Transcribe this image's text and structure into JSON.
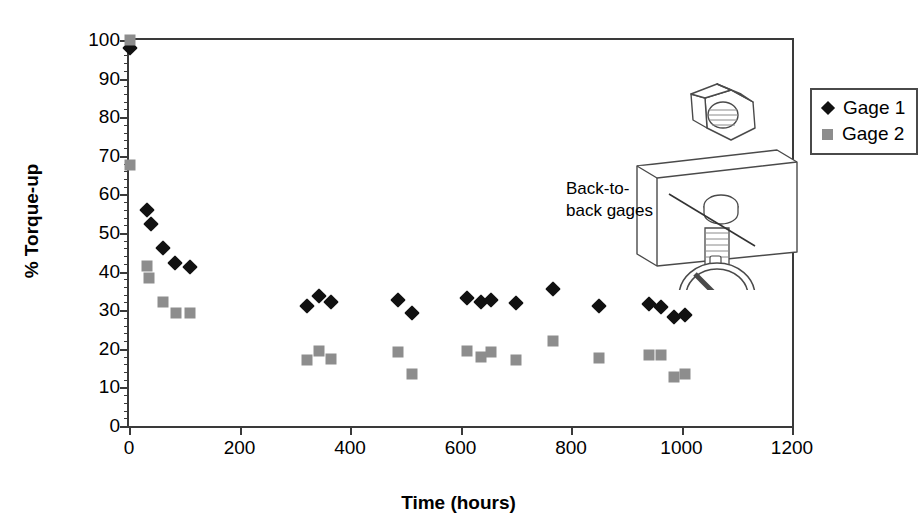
{
  "chart_data": {
    "type": "scatter",
    "title": "",
    "xlabel": "Time (hours)",
    "ylabel": "% Torque-up",
    "xlim": [
      0,
      1200
    ],
    "ylim": [
      0,
      100
    ],
    "xticks": [
      0,
      200,
      400,
      600,
      800,
      1000,
      1200
    ],
    "yticks": [
      0,
      10,
      20,
      30,
      40,
      50,
      60,
      70,
      80,
      90,
      100
    ],
    "y_minor_tick_step": 2,
    "grid": false,
    "legend_position": "top-right",
    "series": [
      {
        "name": "Gage 1",
        "marker": "diamond",
        "color": "#111111",
        "points": [
          [
            2,
            98.0
          ],
          [
            33,
            56.0
          ],
          [
            40,
            52.3
          ],
          [
            62,
            46.0
          ],
          [
            83,
            42.3
          ],
          [
            110,
            41.2
          ],
          [
            322,
            31.2
          ],
          [
            344,
            33.6
          ],
          [
            366,
            32.0
          ],
          [
            487,
            32.7
          ],
          [
            512,
            29.4
          ],
          [
            611,
            33.2
          ],
          [
            637,
            32.2
          ],
          [
            656,
            32.7
          ],
          [
            700,
            31.8
          ],
          [
            767,
            35.6
          ],
          [
            851,
            31.0
          ],
          [
            941,
            31.5
          ],
          [
            963,
            30.8
          ],
          [
            986,
            28.2
          ],
          [
            1006,
            28.8
          ]
        ]
      },
      {
        "name": "Gage 2",
        "marker": "square",
        "color": "#8d8d8d",
        "points": [
          [
            2,
            100.0
          ],
          [
            2,
            67.5
          ],
          [
            33,
            41.4
          ],
          [
            36,
            38.3
          ],
          [
            62,
            32.1
          ],
          [
            85,
            29.2
          ],
          [
            110,
            29.2
          ],
          [
            322,
            17.0
          ],
          [
            344,
            19.4
          ],
          [
            366,
            17.4
          ],
          [
            487,
            19.1
          ],
          [
            512,
            13.4
          ],
          [
            611,
            19.4
          ],
          [
            637,
            18.0
          ],
          [
            656,
            19.2
          ],
          [
            700,
            17.0
          ],
          [
            767,
            22.0
          ],
          [
            851,
            17.5
          ],
          [
            941,
            18.3
          ],
          [
            963,
            18.5
          ],
          [
            986,
            12.8
          ],
          [
            1006,
            13.5
          ]
        ]
      }
    ],
    "annotations": [
      {
        "text_line1": "Back-to-",
        "text_line2": "back gages"
      }
    ]
  },
  "legend": {
    "entries": [
      {
        "label": "Gage 1"
      },
      {
        "label": "Gage 2"
      }
    ]
  },
  "annotation": {
    "line1": "Back-to-",
    "line2": "back gages"
  },
  "axes": {
    "x_title": "Time (hours)",
    "y_title": "% Torque-up",
    "x_labels": [
      "0",
      "200",
      "400",
      "600",
      "800",
      "1000",
      "1200"
    ],
    "y_labels": [
      "0",
      "10",
      "20",
      "30",
      "40",
      "50",
      "60",
      "70",
      "80",
      "90",
      "100"
    ]
  },
  "colors": {
    "gage1": "#111111",
    "gage2": "#8d8d8d",
    "axis": "#3a3a3a",
    "background": "#ffffff"
  }
}
